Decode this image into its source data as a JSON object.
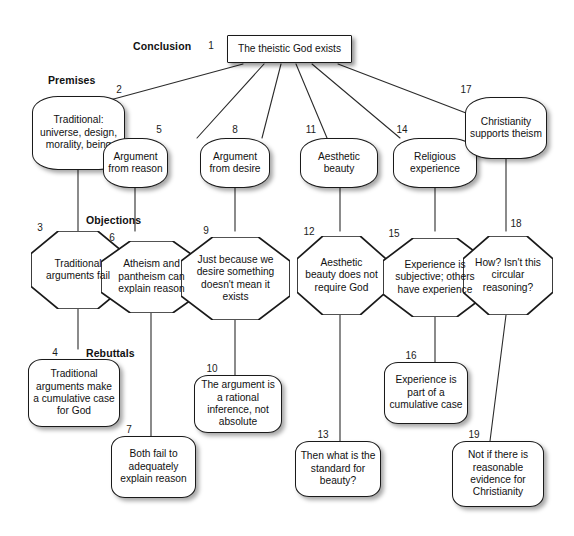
{
  "diagram": {
    "background_color": "#ffffff",
    "node_fill": "#ffffff",
    "node_stroke": "#1a1a1a",
    "edge_color": "#2b2b2b",
    "section_labels": [
      {
        "name": "conclusion",
        "text": "Conclusion"
      },
      {
        "name": "premises",
        "text": "Premises"
      },
      {
        "name": "objections",
        "text": "Objections"
      },
      {
        "name": "rebuttals",
        "text": "Rebuttals"
      }
    ],
    "nodes": [
      {
        "id": "1",
        "text": "The theistic God exists",
        "role": "conclusion",
        "shape": "rect"
      },
      {
        "id": "2",
        "text": "Traditional: universe, design, morality, being",
        "role": "premise",
        "shape": "round"
      },
      {
        "id": "3",
        "text": "Traditional arguments fail",
        "role": "objection",
        "shape": "octagon"
      },
      {
        "id": "4",
        "text": "Traditional arguments make a cumulative case for God",
        "role": "rebuttal",
        "shape": "round"
      },
      {
        "id": "5",
        "text": "Argument from reason",
        "role": "premise",
        "shape": "round"
      },
      {
        "id": "6",
        "text": "Atheism and pantheism can explain reason",
        "role": "objection",
        "shape": "octagon"
      },
      {
        "id": "7",
        "text": "Both fail to adequately explain reason",
        "role": "rebuttal",
        "shape": "round"
      },
      {
        "id": "8",
        "text": "Argument from desire",
        "role": "premise",
        "shape": "round"
      },
      {
        "id": "9",
        "text": "Just because we desire something doesn't mean it exists",
        "role": "objection",
        "shape": "octagon"
      },
      {
        "id": "10",
        "text": "The argument is a rational inference, not absolute",
        "role": "rebuttal",
        "shape": "round"
      },
      {
        "id": "11",
        "text": "Aesthetic beauty",
        "role": "premise",
        "shape": "round"
      },
      {
        "id": "12",
        "text": "Aesthetic beauty does not require God",
        "role": "objection",
        "shape": "octagon"
      },
      {
        "id": "13",
        "text": "Then what is the standard for beauty?",
        "role": "rebuttal",
        "shape": "round"
      },
      {
        "id": "14",
        "text": "Religious experience",
        "role": "premise",
        "shape": "round"
      },
      {
        "id": "15",
        "text": "Experience is subjective; others have experience",
        "role": "objection",
        "shape": "octagon"
      },
      {
        "id": "16",
        "text": "Experience is part of a cumulative case",
        "role": "rebuttal",
        "shape": "round"
      },
      {
        "id": "17",
        "text": "Christianity supports theism",
        "role": "premise",
        "shape": "round"
      },
      {
        "id": "18",
        "text": "How? Isn't this circular reasoning?",
        "role": "objection",
        "shape": "octagon"
      },
      {
        "id": "19",
        "text": "Not if there is reasonable evidence for Christianity",
        "role": "rebuttal",
        "shape": "round"
      }
    ],
    "edges": [
      {
        "from": "1",
        "to": "2"
      },
      {
        "from": "1",
        "to": "5"
      },
      {
        "from": "1",
        "to": "8"
      },
      {
        "from": "1",
        "to": "11"
      },
      {
        "from": "1",
        "to": "14"
      },
      {
        "from": "1",
        "to": "17"
      },
      {
        "from": "2",
        "to": "3"
      },
      {
        "from": "3",
        "to": "4"
      },
      {
        "from": "5",
        "to": "6"
      },
      {
        "from": "6",
        "to": "7"
      },
      {
        "from": "8",
        "to": "9"
      },
      {
        "from": "9",
        "to": "10"
      },
      {
        "from": "11",
        "to": "12"
      },
      {
        "from": "12",
        "to": "13"
      },
      {
        "from": "14",
        "to": "15"
      },
      {
        "from": "15",
        "to": "16"
      },
      {
        "from": "17",
        "to": "18"
      },
      {
        "from": "18",
        "to": "19"
      }
    ]
  }
}
